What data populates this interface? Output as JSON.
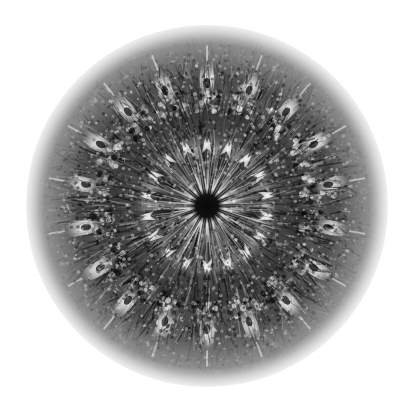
{
  "image": {
    "kind": "radial-symmetry-artwork",
    "title": "Grayscale Radial Kaleidoscope Mandala",
    "description": "Monochrome fibrous radial burst with mirrored kaleidoscopic wedges on a white field",
    "width": 413,
    "height": 417,
    "background_color": "#ffffff",
    "palette": {
      "background": "#ffffff",
      "core": "#131313",
      "deep_shadow": "#1c1c1c",
      "mid_gray": "#6e6e6e",
      "light_gray": "#b9b9b9",
      "highlight": "#ebebeb"
    },
    "geometry": {
      "center_x": 207,
      "center_y": 206,
      "outer_radius": 181,
      "fade_start_radius": 140,
      "symmetry_fold": 18,
      "mirrored_wedges": true
    },
    "bands": [
      {
        "name": "core-disk",
        "r_inner": 0,
        "r_outer": 12,
        "tone": "#131313",
        "note": "solid near-black nucleus"
      },
      {
        "name": "inner-spoke-ring",
        "r_inner": 12,
        "r_outer": 56,
        "tone": "#2b2b2b",
        "note": "18 long dark radial spokes separated by pale slivers"
      },
      {
        "name": "node-ring",
        "r_inner": 52,
        "r_outer": 70,
        "tone": "#d2d2d2",
        "note": "18 bright triangular arrowhead nodes"
      },
      {
        "name": "dense-texture",
        "r_inner": 70,
        "r_outer": 104,
        "tone": "#3a3a3a",
        "note": "dense mottled dark fibre mat"
      },
      {
        "name": "rosette-ring",
        "r_inner": 96,
        "r_outer": 116,
        "tone": "#8f8f8f",
        "note": "18 small granular rosette clusters"
      },
      {
        "name": "teardrop-ring",
        "r_inner": 112,
        "r_outer": 145,
        "tone": "#e0e0e0",
        "note": "18 bright elongated teardrop eyes pointing outward"
      },
      {
        "name": "outer-fringe",
        "r_inner": 142,
        "r_outer": 181,
        "tone": "#757575",
        "note": "fibrous bristle fringe fading to white"
      }
    ],
    "motifs": {
      "spoke_count": 18,
      "node_count": 18,
      "rosette_count": 18,
      "teardrop_count": 18,
      "bristle_strands": 2400
    },
    "render": {
      "noise_seed": 20240607,
      "grain_opacity": 0.35,
      "edge_softness": 42
    }
  }
}
